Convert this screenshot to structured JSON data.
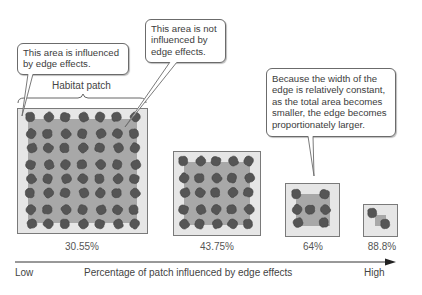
{
  "callouts": {
    "edge": "This area is influenced by edge effects.",
    "interior": "This area is not influenced by edge effects.",
    "explanation": "Because the width of the edge is relatively constant, as the total area becomes smaller, the edge becomes proportionately larger."
  },
  "bracket_label": "Habitat patch",
  "patches": [
    {
      "label": "30.55%",
      "size": "large"
    },
    {
      "label": "43.75%",
      "size": "medium"
    },
    {
      "label": "64%",
      "size": "small"
    },
    {
      "label": "88.8%",
      "size": "tiny"
    }
  ],
  "axis": {
    "low": "Low",
    "title": "Percentage of patch influenced by edge effects",
    "high": "High"
  },
  "colors": {
    "edge_zone": "#e6e6e6",
    "interior_zone": "#a8a8a8",
    "organism": "#555555",
    "border": "#7a7a7a"
  }
}
